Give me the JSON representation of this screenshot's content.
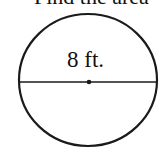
{
  "problem": {
    "prompt_text": "Find the area"
  },
  "figure": {
    "shape": "circle",
    "diameter_label": "8 ft.",
    "diameter_value": 8,
    "unit": "ft.",
    "stroke_color": "#1a1a1a",
    "background_color": "#ffffff"
  }
}
